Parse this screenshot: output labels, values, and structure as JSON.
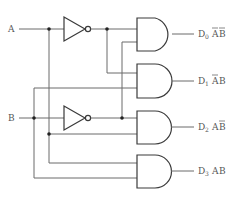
{
  "diagram": {
    "inputs": [
      {
        "id": "A",
        "label": "A"
      },
      {
        "id": "B",
        "label": "B"
      }
    ],
    "inverters": [
      {
        "id": "not-a",
        "input": "A",
        "output": "A'"
      },
      {
        "id": "not-b",
        "input": "B",
        "output": "B'"
      }
    ],
    "outputs": [
      {
        "id": "D0",
        "name": "D",
        "index": "0",
        "term_a": "A",
        "a_bar": true,
        "term_b": "B",
        "b_bar": true
      },
      {
        "id": "D1",
        "name": "D",
        "index": "1",
        "term_a": "A",
        "a_bar": true,
        "term_b": "B",
        "b_bar": false
      },
      {
        "id": "D2",
        "name": "D",
        "index": "2",
        "term_a": "A",
        "a_bar": false,
        "term_b": "B",
        "b_bar": true
      },
      {
        "id": "D3",
        "name": "D",
        "index": "3",
        "term_a": "A",
        "a_bar": false,
        "term_b": "B",
        "b_bar": false
      }
    ],
    "colors": {
      "wire": "#6a6a6a",
      "gate_stroke": "#3a3a3a",
      "junction": "#222222",
      "text": "#555555"
    }
  }
}
